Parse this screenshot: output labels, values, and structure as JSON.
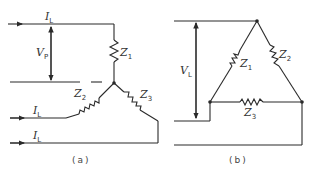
{
  "diagram": {
    "type": "three-phase load connections",
    "panel_a": {
      "caption": "(a)",
      "connection": "star",
      "labels": {
        "line_current_top": {
          "main": "I",
          "sub": "L"
        },
        "line_current_mid": {
          "main": "I",
          "sub": "L"
        },
        "line_current_bottom": {
          "main": "I",
          "sub": "L"
        },
        "phase_voltage": {
          "main": "V",
          "sub": "P"
        },
        "z1": {
          "main": "Z",
          "sub": "1"
        },
        "z2": {
          "main": "Z",
          "sub": "2"
        },
        "z3": {
          "main": "Z",
          "sub": "3"
        }
      }
    },
    "panel_b": {
      "caption": "(b)",
      "connection": "delta",
      "labels": {
        "line_voltage": {
          "main": "V",
          "sub": "L"
        },
        "z1": {
          "main": "Z",
          "sub": "1"
        },
        "z2": {
          "main": "Z",
          "sub": "2"
        },
        "z3": {
          "main": "Z",
          "sub": "3"
        }
      }
    }
  }
}
